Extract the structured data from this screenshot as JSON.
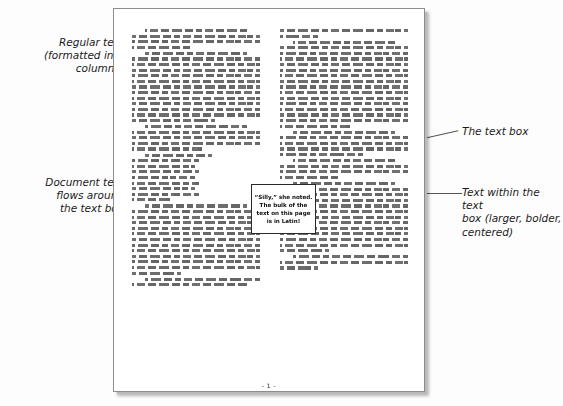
{
  "annotations": [
    {
      "id": "regular-text",
      "text": "Regular text\n(formatted into\ncolumns)",
      "side": "left"
    },
    {
      "id": "flow-around",
      "text": "Document text\nflows around\nthe text box",
      "side": "left"
    },
    {
      "id": "the-text-box",
      "text": "The text box",
      "side": "right"
    },
    {
      "id": "text-within-box",
      "text": "Text within the text\nbox (larger, bolder,\ncentered)",
      "side": "right"
    }
  ],
  "document": {
    "page_number": "- 1 -",
    "textbox": {
      "content": "“Silly,” she noted. The bulk of the text on this page is in Latin!"
    },
    "body_language_note": "Lorem ipsum placeholder Latin text"
  },
  "colors": {
    "page_background": "#ffffff",
    "page_border": "#8d8d8d",
    "canvas_background": "#fdfdfd",
    "leader_line": "#555555",
    "annotation_text": "#1b1b1b",
    "textbox_border": "#2a2a2a"
  }
}
